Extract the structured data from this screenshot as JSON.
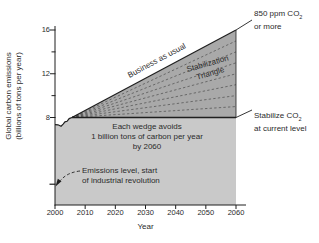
{
  "chart_data": {
    "type": "area",
    "xlabel": "Year",
    "ylabel_line1": "Global carbon emissions",
    "ylabel_line2": "(billions of tons per year)",
    "xlim": [
      2000,
      2062
    ],
    "ylim": [
      0,
      16.5
    ],
    "x_ticks": [
      2000,
      2010,
      2020,
      2030,
      2040,
      2050,
      2060
    ],
    "y_ticks": [
      8,
      12,
      16
    ],
    "y_minor_ticks": [
      10,
      14
    ],
    "grid": false,
    "series": [
      {
        "name": "historical-emissions",
        "points": [
          [
            2000,
            7.35
          ],
          [
            2001,
            7.33
          ],
          [
            2002,
            7.2
          ],
          [
            2002.7,
            7.4
          ],
          [
            2003.3,
            7.6
          ],
          [
            2004,
            7.65
          ],
          [
            2004.7,
            7.9
          ],
          [
            2005.6,
            8.0
          ]
        ]
      },
      {
        "name": "business-as-usual",
        "points": [
          [
            2005.6,
            8
          ],
          [
            2060,
            16
          ]
        ]
      },
      {
        "name": "stabilized-flat-path",
        "points": [
          [
            2005.6,
            8
          ],
          [
            2060,
            8
          ]
        ]
      }
    ],
    "stabilization_triangle": {
      "apex": [
        2005.6,
        8
      ],
      "right_top": [
        2060,
        16
      ],
      "right_bottom": [
        2060,
        8
      ],
      "wedge_count": 8,
      "wedge_size_billion_tons_per_year": 1,
      "wedge_boundaries_at_2060": [
        9,
        10,
        11,
        12,
        13,
        14,
        15
      ]
    },
    "industrial_revolution_level": 1.9,
    "colors": {
      "triangle_fill": "#a9a9a9",
      "below_fill": "#c9c9c9",
      "line": "#1f1f1f",
      "wedge_dash": "#3d3d3d",
      "text": "#2b2b2b"
    }
  },
  "labels": {
    "business_as_usual": "Business as usual",
    "stabilization_line1": "Stabilization",
    "stabilization_line2": "Triangle",
    "wedge_note_line1": "Each wedge avoids",
    "wedge_note_line2": "1 billion tons of carbon per year",
    "wedge_note_line3": "by 2060",
    "ppm_pre": "850 ppm CO",
    "ppm_sub": "2",
    "ppm_line2": "or more",
    "stabilize_pre": "Stabilize CO",
    "stabilize_sub": "2",
    "stabilize_line2": "at current level",
    "emissions_note_line1": "Emissions level, start",
    "emissions_note_line2": "of industrial revolution",
    "x_axis_title": "Year"
  }
}
